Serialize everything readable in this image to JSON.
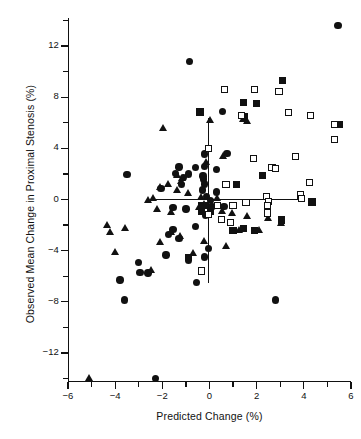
{
  "chart_data": {
    "type": "scatter",
    "title": "",
    "xlabel": "Predicted Change (%)",
    "ylabel": "Observed Mean Change in Proximal Stenosis (%)",
    "xlim": [
      -6,
      6
    ],
    "ylim": [
      -14.2,
      14.2
    ],
    "xticks": [
      -6,
      -4,
      -2,
      0,
      2,
      4,
      6
    ],
    "xtick_labels": [
      "−6",
      "−4",
      "−2",
      "0",
      "2",
      "4",
      "6"
    ],
    "xticks_minor": [
      -5,
      -3,
      -1,
      1,
      3,
      5
    ],
    "yticks": [
      12,
      8,
      4,
      0,
      -4,
      -8,
      -12
    ],
    "ytick_labels": [
      "12",
      "8",
      "4",
      "0",
      "−4",
      "−8",
      "−12"
    ],
    "yticks_minor": [
      14,
      10,
      6,
      2,
      -2,
      -6,
      -10,
      -14
    ],
    "grid": false,
    "legend": null,
    "annotations": [
      {
        "name": "reference-line-horizontal",
        "type": "hline",
        "y": 0,
        "x_from": -2.5,
        "x_to": 4.0
      },
      {
        "name": "reference-line-vertical",
        "type": "vline",
        "x": -0.05,
        "y_from": -6.5,
        "y_to": 6.4
      }
    ],
    "series": [
      {
        "name": "filled-circle",
        "marker": "circle",
        "fill": "solid",
        "color": "#111111",
        "points": [
          [
            5.45,
            13.6
          ],
          [
            -0.85,
            10.8
          ],
          [
            0.55,
            6.9
          ],
          [
            -0.2,
            3.55
          ],
          [
            0.75,
            3.6
          ],
          [
            -0.6,
            2.5
          ],
          [
            -1.3,
            2.55
          ],
          [
            -3.5,
            1.95
          ],
          [
            -1.45,
            2.05
          ],
          [
            -0.9,
            2.0
          ],
          [
            0.3,
            2.35
          ],
          [
            -0.2,
            2.6
          ],
          [
            -0.25,
            1.6
          ],
          [
            -0.2,
            1.2
          ],
          [
            -1.2,
            1.15
          ],
          [
            -2.05,
            0.85
          ],
          [
            -0.3,
            0.75
          ],
          [
            0.3,
            0.6
          ],
          [
            -0.12,
            0.25
          ],
          [
            0.05,
            -0.1
          ],
          [
            0.62,
            -0.55
          ],
          [
            -1.55,
            -0.65
          ],
          [
            -1.0,
            -0.75
          ],
          [
            -0.35,
            -0.85
          ],
          [
            -0.18,
            -1.25
          ],
          [
            -0.6,
            -2.1
          ],
          [
            -1.55,
            -2.35
          ],
          [
            -1.75,
            -2.75
          ],
          [
            -1.3,
            -3.05
          ],
          [
            -0.05,
            -3.85
          ],
          [
            -1.85,
            -4.35
          ],
          [
            -0.9,
            -4.75
          ],
          [
            -3.0,
            -4.95
          ],
          [
            -2.6,
            -5.75
          ],
          [
            -0.2,
            -4.5
          ],
          [
            -2.95,
            -5.7
          ],
          [
            -3.8,
            -6.3
          ],
          [
            -0.55,
            -6.5
          ],
          [
            -3.6,
            -7.85
          ],
          [
            2.8,
            -7.85
          ],
          [
            -2.3,
            -14.0
          ],
          [
            0.1,
            -0.55
          ],
          [
            -0.28,
            1.85
          ],
          [
            -1.1,
            1.7
          ]
        ]
      },
      {
        "name": "filled-triangle",
        "marker": "triangle",
        "fill": "solid",
        "color": "#111111",
        "points": [
          [
            -1.95,
            5.6
          ],
          [
            0.05,
            6.2
          ],
          [
            1.45,
            6.3
          ],
          [
            1.6,
            6.1
          ],
          [
            0.6,
            3.35
          ],
          [
            -0.12,
            2.9
          ],
          [
            -1.35,
            1.9
          ],
          [
            -1.15,
            1.65
          ],
          [
            -1.2,
            1.45
          ],
          [
            -1.75,
            1.2
          ],
          [
            -2.1,
            0.95
          ],
          [
            -1.35,
            0.75
          ],
          [
            -0.9,
            0.45
          ],
          [
            -2.4,
            0.1
          ],
          [
            -2.6,
            -0.05
          ],
          [
            -0.2,
            -0.35
          ],
          [
            -0.45,
            -0.65
          ],
          [
            -2.2,
            -0.75
          ],
          [
            -1.6,
            -1.0
          ],
          [
            0.55,
            -0.9
          ],
          [
            0.95,
            -1.1
          ],
          [
            1.6,
            -1.35
          ],
          [
            2.5,
            -1.5
          ],
          [
            3.05,
            -1.85
          ],
          [
            -4.35,
            -2.0
          ],
          [
            -3.55,
            -2.3
          ],
          [
            -4.2,
            -2.55
          ],
          [
            -1.6,
            -2.55
          ],
          [
            -1.25,
            -2.85
          ],
          [
            -2.1,
            -3.35
          ],
          [
            -0.2,
            -3.3
          ],
          [
            0.7,
            -3.65
          ],
          [
            -0.7,
            -4.2
          ],
          [
            -4.0,
            -4.15
          ],
          [
            -2.45,
            -5.55
          ],
          [
            -5.1,
            -14.0
          ],
          [
            1.25,
            -2.45
          ],
          [
            2.1,
            -2.4
          ],
          [
            -0.35,
            0.15
          ],
          [
            0.35,
            0.05
          ]
        ]
      },
      {
        "name": "filled-square",
        "marker": "square",
        "fill": "solid",
        "color": "#111111",
        "points": [
          [
            3.1,
            9.3
          ],
          [
            1.45,
            7.6
          ],
          [
            2.0,
            7.5
          ],
          [
            -0.4,
            6.85
          ],
          [
            1.5,
            6.5
          ],
          [
            0.7,
            1.15
          ],
          [
            1.15,
            1.15
          ],
          [
            2.25,
            1.9
          ],
          [
            -0.35,
            -0.45
          ],
          [
            -0.35,
            -0.9
          ],
          [
            5.5,
            5.85
          ],
          [
            4.35,
            -0.2
          ],
          [
            1.0,
            -2.45
          ],
          [
            1.45,
            -2.25
          ],
          [
            1.9,
            -2.45
          ],
          [
            3.05,
            -1.6
          ],
          [
            -0.9,
            -4.55
          ],
          [
            0.05,
            -0.95
          ],
          [
            -0.2,
            -0.45
          ]
        ]
      },
      {
        "name": "open-square",
        "marker": "square",
        "fill": "open",
        "color": "#111111",
        "points": [
          [
            0.65,
            8.6
          ],
          [
            1.9,
            8.6
          ],
          [
            2.95,
            8.45
          ],
          [
            3.35,
            6.8
          ],
          [
            4.3,
            6.55
          ],
          [
            5.3,
            5.85
          ],
          [
            5.3,
            4.7
          ],
          [
            -0.05,
            4.0
          ],
          [
            1.85,
            3.2
          ],
          [
            3.65,
            3.35
          ],
          [
            2.65,
            2.5
          ],
          [
            2.8,
            2.45
          ],
          [
            4.25,
            1.35
          ],
          [
            0.7,
            1.15
          ],
          [
            3.85,
            0.35
          ],
          [
            3.9,
            0.05
          ],
          [
            2.4,
            0.25
          ],
          [
            2.5,
            -0.15
          ],
          [
            2.45,
            -0.45
          ],
          [
            1.55,
            -0.25
          ],
          [
            0.35,
            -0.45
          ],
          [
            1.0,
            -0.45
          ],
          [
            0.5,
            -1.55
          ],
          [
            -0.05,
            -1.2
          ],
          [
            0.9,
            -1.8
          ],
          [
            -0.35,
            -5.6
          ],
          [
            1.35,
            6.55
          ],
          [
            2.45,
            -1.05
          ]
        ]
      }
    ]
  },
  "figure": {
    "background": "#ffffff",
    "foreground": "#111111"
  }
}
